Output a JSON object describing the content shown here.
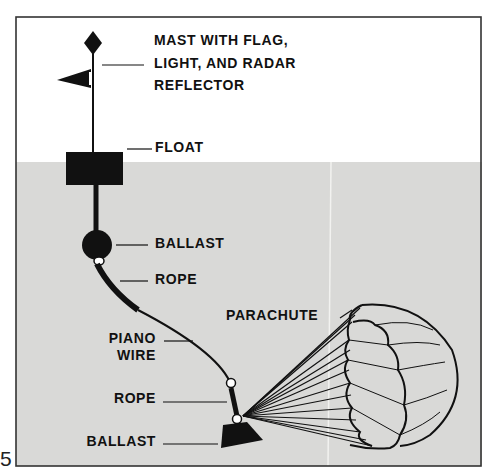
{
  "figure": {
    "number": "5",
    "colors": {
      "water": "#d9d9d7",
      "air": "#ffffff",
      "ink": "#111111",
      "frame": "#333333"
    },
    "labels": {
      "mast_line1": "MAST WITH FLAG,",
      "mast_line2": "LIGHT, AND RADAR",
      "mast_line3": "REFLECTOR",
      "float": "FLOAT",
      "ballast_upper": "BALLAST",
      "rope_upper": "ROPE",
      "parachute": "PARACHUTE",
      "piano_line1": "PIANO",
      "piano_line2": "WIRE",
      "rope_lower": "ROPE",
      "ballast_lower": "BALLAST"
    }
  }
}
